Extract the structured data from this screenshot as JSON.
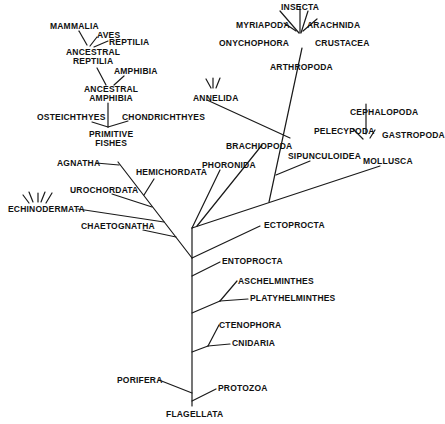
{
  "diagram": {
    "type": "phylogenetic-tree",
    "line_color": "#1a1a1a",
    "text_color": "#111111",
    "background": "#ffffff",
    "labels": {
      "mammalia": "MAMMALIA",
      "aves": "AVES",
      "reptilia": "REPTILIA",
      "ancestral_reptilia_1": "ANCESTRAL",
      "ancestral_reptilia_2": "REPTILIA",
      "amphibia": "AMPHIBIA",
      "ancestral_amphibia_1": "ANCESTRAL",
      "ancestral_amphibia_2": "AMPHIBIA",
      "osteichthyes": "OSTEICHTHYES",
      "chondrichthyes": "CHONDRICHTHYES",
      "primitive_fishes_1": "PRIMITIVE",
      "primitive_fishes_2": "FISHES",
      "agnatha": "AGNATHA",
      "hemichordata": "HEMICHORDATA",
      "urochordata": "UROCHORDATA",
      "echinodermata": "ECHINODERMATA",
      "chaetognatha": "CHAETOGNATHA",
      "insecta": "INSECTA",
      "myriapoda": "MYRIAPODA",
      "arachnida": "ARACHNIDA",
      "onychophora": "ONYCHOPHORA",
      "crustacea": "CRUSTACEA",
      "arthropoda": "ARTHROPODA",
      "annelida": "ANNELIDA",
      "cephalopoda": "CEPHALOPODA",
      "pelecypoda": "PELECYPODA",
      "gastropoda": "GASTROPODA",
      "mollusca": "MOLLUSCA",
      "brachiopoda": "BRACHIOPODA",
      "phoronida": "PHORONIDA",
      "sipunculoidea": "SIPUNCULOIDEA",
      "ectoprocta": "ECTOPROCTA",
      "entoprocta": "ENTOPROCTA",
      "aschelminthes": "ASCHELMINTHES",
      "platyhelminthes": "PLATYHELMINTHES",
      "ctenophora": "CTENOPHORA",
      "cnidaria": "CNIDARIA",
      "porifera": "PORIFERA",
      "protozoa": "PROTOZOA",
      "flagellata": "FLAGELLATA"
    }
  }
}
